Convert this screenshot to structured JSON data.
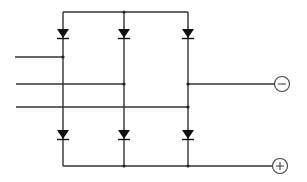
{
  "diagram": {
    "type": "three-phase bridge rectifier",
    "colors": {
      "wire": "#333333",
      "diode": "#111111",
      "terminal": "#444444",
      "background": "#ffffff"
    },
    "columns_x": [
      63,
      124,
      188
    ],
    "top_rail_y": 12,
    "bottom_rail_y": 166,
    "inputs": [
      {
        "name": "phase-1",
        "y": 57,
        "x_start": 15,
        "x_end": 63
      },
      {
        "name": "phase-2",
        "y": 84,
        "x_start": 16,
        "x_end": 124
      },
      {
        "name": "phase-3",
        "y": 107,
        "x_start": 16,
        "x_end": 188
      }
    ],
    "top_diodes_y": 33,
    "bottom_diodes_y": 134,
    "terminals": [
      {
        "name": "negative-terminal",
        "symbol": "−",
        "cx": 282,
        "cy": 84
      },
      {
        "name": "positive-terminal",
        "symbol": "+",
        "cx": 280,
        "cy": 166
      }
    ]
  }
}
